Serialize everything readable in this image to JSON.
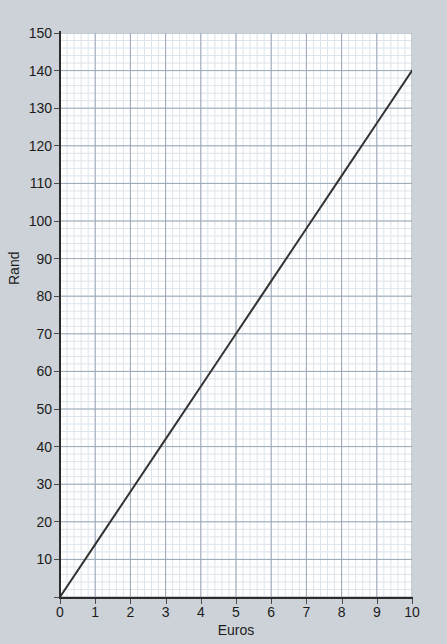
{
  "figure": {
    "background_color": "#ccd2d7",
    "plot_background_color": "#ffffff",
    "clipped_text_top": "",
    "clipped_text_bottom": ""
  },
  "chart_data": {
    "type": "line",
    "title": "",
    "subtitle": "",
    "xlabel": "Euros",
    "ylabel": "Rand",
    "xlim": [
      0,
      10
    ],
    "ylim": [
      0,
      150
    ],
    "x_major_tick_step": 1,
    "y_major_tick_step": 10,
    "x_minor_divisions_per_major": 5,
    "y_minor_divisions_per_major": 5,
    "x_tick_labels": [
      "0",
      "1",
      "2",
      "3",
      "4",
      "5",
      "6",
      "7",
      "8",
      "9",
      "10"
    ],
    "y_tick_labels": [
      "0",
      "10",
      "20",
      "30",
      "40",
      "50",
      "60",
      "70",
      "80",
      "90",
      "100",
      "110",
      "120",
      "130",
      "140",
      "150"
    ],
    "grid": true,
    "major_grid_color": "#9aa6b4",
    "minor_grid_color": "#dce4ec",
    "legend": null,
    "legend_position": "none",
    "annotations": [],
    "series": [
      {
        "name": "Euro to Rand conversion",
        "color": "#333333",
        "line_width": 2,
        "marker": "none",
        "slope": 14,
        "intercept": 0,
        "x": [
          0,
          1,
          2,
          3,
          4,
          5,
          6,
          7,
          8,
          9,
          10
        ],
        "values": [
          0,
          14,
          28,
          42,
          56,
          70,
          84,
          98,
          112,
          126,
          140
        ],
        "endpoints": [
          [
            0,
            0
          ],
          [
            10,
            140
          ]
        ]
      }
    ]
  }
}
